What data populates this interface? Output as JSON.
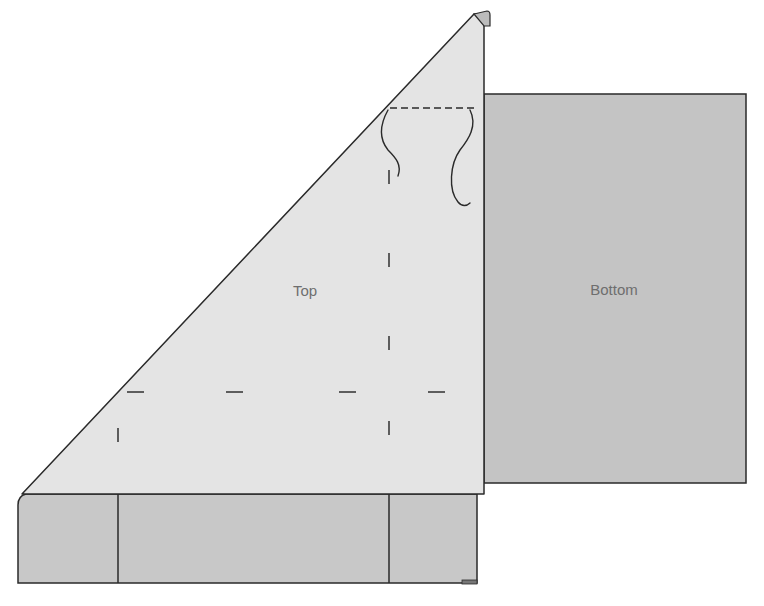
{
  "diagram": {
    "width": 764,
    "height": 606,
    "colors": {
      "background": "#ffffff",
      "top_fill": "#e4e4e4",
      "bottom_fill": "#c4c4c4",
      "base_fill": "#c8c8c8",
      "tip_fill": "#bcbcbc",
      "outline": "#2a2a2a",
      "marks": "#3a3a3a",
      "label_text": "#6e6e6e"
    },
    "labels": {
      "top": {
        "text": "Top",
        "x": 305,
        "y": 290
      },
      "bottom": {
        "text": "Bottom",
        "x": 614,
        "y": 289
      }
    },
    "shapes": {
      "bottom_panel": {
        "x": 484,
        "y": 94,
        "w": 262,
        "h": 389
      },
      "top_triangle": {
        "points": [
          [
            22,
            494
          ],
          [
            474,
            14
          ],
          [
            484,
            14
          ],
          [
            484,
            494
          ]
        ]
      },
      "tip": {
        "path": "M474 14 L487 11 Q490 11 490 15 L490 26 L484 26 Z"
      },
      "base_strip": {
        "path": "M18 583 L18 505 Q18 496 26 494 L477 494 L477 583 Z"
      },
      "base_foot": {
        "x": 462,
        "y": 580,
        "w": 15,
        "h": 4
      }
    },
    "lines": {
      "base_dividers": [
        {
          "x1": 118,
          "y1": 494,
          "x2": 118,
          "y2": 583
        },
        {
          "x1": 389,
          "y1": 494,
          "x2": 389,
          "y2": 583
        }
      ],
      "dashed_top": {
        "x1": 390,
        "y1": 108,
        "x2": 474,
        "y2": 108
      }
    },
    "marks": {
      "horizontal_ticks": [
        {
          "x1": 127,
          "y1": 392,
          "x2": 144,
          "y2": 392
        },
        {
          "x1": 226,
          "y1": 392,
          "x2": 243,
          "y2": 392
        },
        {
          "x1": 339,
          "y1": 392,
          "x2": 356,
          "y2": 392
        },
        {
          "x1": 428,
          "y1": 392,
          "x2": 445,
          "y2": 392
        }
      ],
      "vertical_ticks": [
        {
          "x1": 118,
          "y1": 428,
          "x2": 118,
          "y2": 442
        },
        {
          "x1": 389,
          "y1": 170,
          "x2": 389,
          "y2": 184
        },
        {
          "x1": 389,
          "y1": 253,
          "x2": 389,
          "y2": 267
        },
        {
          "x1": 389,
          "y1": 336,
          "x2": 389,
          "y2": 350
        },
        {
          "x1": 389,
          "y1": 421,
          "x2": 389,
          "y2": 435
        }
      ]
    },
    "curves": [
      {
        "name": "left-hook-curve",
        "d": "M388 110 C378 128, 380 140, 388 150 C396 158, 402 165, 398 176"
      },
      {
        "name": "right-hook-curve",
        "d": "M470 110 C478 126, 468 140, 460 150 C450 164, 448 190, 458 202 C462 207, 467 206, 470 203"
      }
    ]
  }
}
